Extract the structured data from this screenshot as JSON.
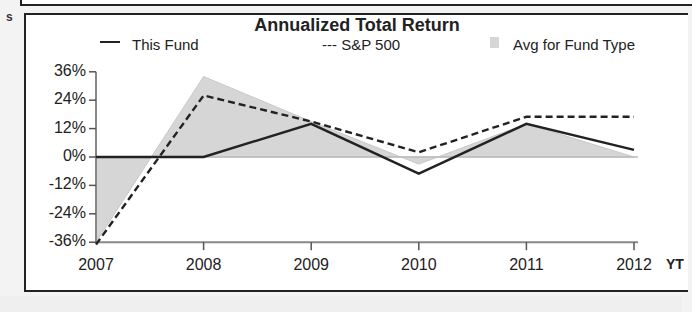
{
  "chart_data": {
    "type": "line",
    "title": "Annualized Total Return",
    "xlabel": "",
    "ylabel": "",
    "categories": [
      "2007",
      "2008",
      "2009",
      "2010",
      "2011",
      "2012"
    ],
    "extra_x_label": "YT",
    "ylim": [
      -36,
      36
    ],
    "yticks": [
      "36%",
      "24%",
      "12%",
      "0%",
      "-12%",
      "-24%",
      "-36%"
    ],
    "legend_position": "top",
    "grid": false,
    "series": [
      {
        "name": "This Fund",
        "style": "solid",
        "values": [
          0,
          0,
          14,
          -7,
          14,
          3
        ]
      },
      {
        "name": "S&P 500",
        "style": "dashed",
        "values": [
          -37,
          26,
          15,
          2,
          17,
          17
        ]
      },
      {
        "name": "Avg for Fund Type",
        "style": "area",
        "values": [
          -36,
          34,
          15,
          -3,
          14,
          0
        ]
      }
    ]
  },
  "legend": {
    "fund": "This Fund",
    "sp": "--- S&P 500",
    "avg": "Avg for Fund Type"
  },
  "margin_mark": "s",
  "colors": {
    "line": "#222222",
    "area": "#d6d6d6"
  }
}
